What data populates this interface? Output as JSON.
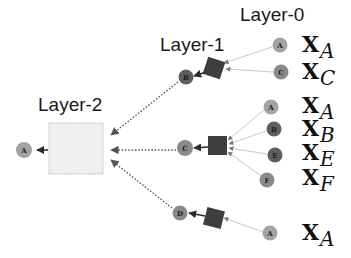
{
  "layers": {
    "layer0": "Layer-0",
    "layer1": "Layer-1",
    "layer2": "Layer-2"
  },
  "colors": {
    "light_node": "#a3a3a3",
    "dark_node": "#5e5e5e",
    "mid_node": "#8a8a8a",
    "square": "#3e3e3e",
    "layer2_box_fill": "#efefef",
    "layer2_box_border": "#b5b5b5",
    "dotted_edge": "#555555",
    "thin_edge": "#c8c8c8"
  },
  "root": {
    "label": "A"
  },
  "layer1_nodes": [
    {
      "label": "B"
    },
    {
      "label": "C"
    },
    {
      "label": "D"
    }
  ],
  "layer0_groups": [
    {
      "parent": "B",
      "nodes": [
        {
          "label": "A"
        },
        {
          "label": "C"
        }
      ]
    },
    {
      "parent": "C",
      "nodes": [
        {
          "label": "A"
        },
        {
          "label": "B"
        },
        {
          "label": "E"
        },
        {
          "label": "F"
        }
      ]
    },
    {
      "parent": "D",
      "nodes": [
        {
          "label": "A"
        }
      ]
    }
  ],
  "features": [
    {
      "base": "X",
      "sub": "A"
    },
    {
      "base": "X",
      "sub": "C"
    },
    {
      "base": "X",
      "sub": "A"
    },
    {
      "base": "X",
      "sub": "B"
    },
    {
      "base": "X",
      "sub": "E"
    },
    {
      "base": "X",
      "sub": "F"
    },
    {
      "base": "X",
      "sub": "A"
    }
  ]
}
